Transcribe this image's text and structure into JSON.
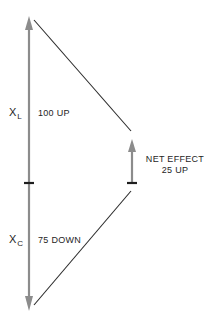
{
  "colors": {
    "axis": "#8c8c8c",
    "line": "#2a2a2a",
    "tick": "#1e1e1e",
    "text": "#1e1e1e",
    "background": "#ffffff"
  },
  "labels": {
    "xl_symbol": "X",
    "xl_sub": "L",
    "xl_value": "100 UP",
    "xc_symbol": "X",
    "xc_sub": "C",
    "xc_value": "75 DOWN",
    "net_line1": "NET EFFECT",
    "net_line2": "25 UP"
  },
  "diagram": {
    "components": [
      {
        "name": "X_L",
        "magnitude": 100,
        "direction": "up"
      },
      {
        "name": "X_C",
        "magnitude": 75,
        "direction": "down"
      }
    ],
    "net": {
      "magnitude": 25,
      "direction": "up"
    }
  }
}
